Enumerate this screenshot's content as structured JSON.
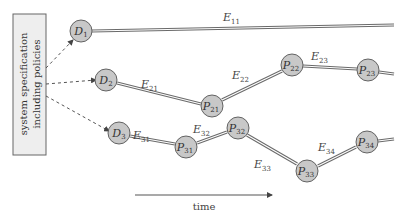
{
  "spec_box": {
    "line1": "system specification",
    "line2": "including policies"
  },
  "nodes": {
    "D1": {
      "main": "D",
      "sub": "1"
    },
    "D2": {
      "main": "D",
      "sub": "2"
    },
    "D3": {
      "main": "D",
      "sub": "3"
    },
    "P21": {
      "main": "P",
      "sub": "21"
    },
    "P22": {
      "main": "P",
      "sub": "22"
    },
    "P23": {
      "main": "P",
      "sub": "23"
    },
    "P31": {
      "main": "P",
      "sub": "31"
    },
    "P32": {
      "main": "P",
      "sub": "32"
    },
    "P33": {
      "main": "P",
      "sub": "33"
    },
    "P34": {
      "main": "P",
      "sub": "34"
    }
  },
  "edges": {
    "E11": {
      "main": "E",
      "sub": "11"
    },
    "E21": {
      "main": "E",
      "sub": "21"
    },
    "E22": {
      "main": "E",
      "sub": "22"
    },
    "E23": {
      "main": "E",
      "sub": "23"
    },
    "E31": {
      "main": "E",
      "sub": "31"
    },
    "E32": {
      "main": "E",
      "sub": "32"
    },
    "E33": {
      "main": "E",
      "sub": "33"
    },
    "E34": {
      "main": "E",
      "sub": "34"
    }
  },
  "time_axis": {
    "label": "time"
  },
  "colors": {
    "node_fill": "#c8c8c8",
    "box_fill": "#eeeeee",
    "line": "#6a6a6a"
  }
}
